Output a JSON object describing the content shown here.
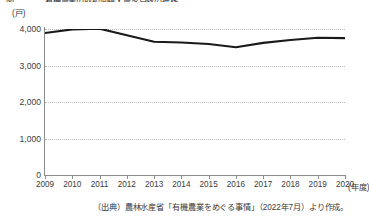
{
  "chart_data": {
    "type": "line",
    "title": "図　　　　有機農業の取組面積・農家戸数の推移",
    "y_unit_label": "(戸)",
    "x_unit_label": "(年度)",
    "categories": [
      "2009",
      "2010",
      "2011",
      "2012",
      "2013",
      "2014",
      "2015",
      "2016",
      "2017",
      "2018",
      "2019",
      "2020"
    ],
    "series": [
      {
        "name": "有機農業取組農家戸数",
        "color": "#1a1a1a",
        "values": [
          3890,
          3990,
          4010,
          3830,
          3650,
          3630,
          3590,
          3500,
          3620,
          3700,
          3760,
          3750
        ]
      }
    ],
    "ylabel": "",
    "xlabel": "",
    "ylim": [
      0,
      4000
    ],
    "yticks": [
      0,
      1000,
      2000,
      3000,
      4000
    ],
    "ytick_labels": [
      "0",
      "1,000",
      "2,000",
      "3,000",
      "4,000"
    ],
    "grid": true,
    "grid_style": "dotted-horizontal",
    "legend": "none",
    "source_note": "（出典）農林水産省「有機農業をめぐる事情」（2022年7月）より作成。"
  }
}
